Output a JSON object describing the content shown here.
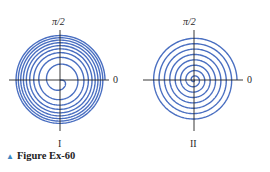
{
  "figure": {
    "caption_marker": "▲",
    "caption": "Figure Ex-60",
    "spiral_color": "#4a6fc1",
    "axis_color": "#222222"
  },
  "panels": [
    {
      "id": "I",
      "label": "I",
      "top_label": "π/2",
      "right_label": "0",
      "spiral_type": "compressing outward (e.g. r = √θ)",
      "turns": 9
    },
    {
      "id": "II",
      "label": "II",
      "top_label": "π/2",
      "right_label": "0",
      "spiral_type": "evenly spaced (Archimedean r = θ)",
      "turns": 8
    }
  ]
}
